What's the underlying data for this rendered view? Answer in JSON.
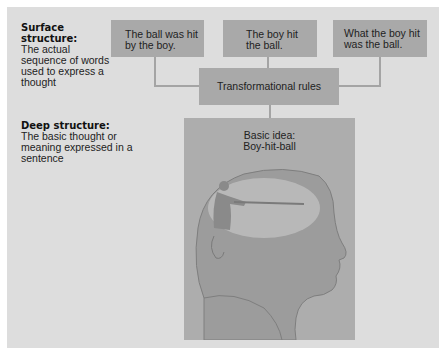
{
  "surface": {
    "heading": "Surface structure:",
    "description": "The actual sequence of words used to express a thought"
  },
  "deep": {
    "heading": "Deep structure:",
    "description": "The basic thought or meaning expressed in a sentence"
  },
  "sentences": [
    {
      "line1": "The ball was hit",
      "line2": "by the boy."
    },
    {
      "line1": "The boy hit",
      "line2": "the ball."
    },
    {
      "line1": "What the boy hit",
      "line2": "was the ball."
    }
  ],
  "transform": {
    "label": "Transformational rules"
  },
  "basic_idea": {
    "line1": "Basic idea:",
    "line2": "Boy-hit-ball"
  },
  "figure": {
    "icon": "head-profile-with-batter-silhouette"
  },
  "colors": {
    "panel": "#dddddd",
    "box": "#a9a9a9",
    "line": "#a4a4a4"
  }
}
